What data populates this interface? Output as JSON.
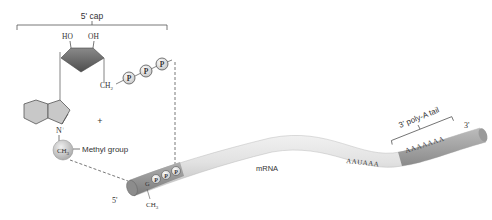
{
  "diagram": {
    "cap": {
      "label": "5' cap",
      "ribose_labels": {
        "ho": "HO",
        "oh": "OH",
        "ch2": "CH",
        "ch2_sub": "2"
      },
      "phosphate_label": "P",
      "phosphate_count": 3,
      "plus_sign": "+",
      "nitrogen_label": "N",
      "nitrogen_charge": "+",
      "methyl_label": "CH",
      "methyl_sub": "3",
      "methyl_group_label": "Methyl group"
    },
    "mrna": {
      "label": "mRNA",
      "five_prime": "5'",
      "three_prime": "3'",
      "cap_nucleotide": "G",
      "cap_methyl": "CH",
      "cap_methyl_sub": "3",
      "signal_sequence": "AAUAAA",
      "tail_sequence": "AAAAAAA",
      "tail_label": "3' poly-A tail"
    },
    "colors": {
      "mrna_body": "#e6e6e6",
      "mrna_shadow": "#b8b8b8",
      "cap_end": "#8e8e8e",
      "tail": "#a0a0a0",
      "ribose": "#6e6e6e",
      "ring": "#c8c8c8",
      "line": "#555555"
    }
  }
}
